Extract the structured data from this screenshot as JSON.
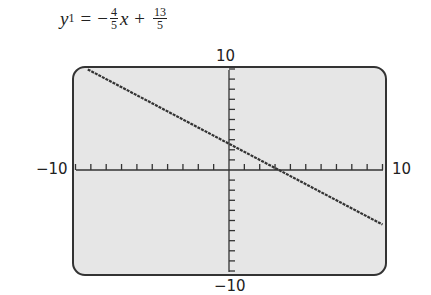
{
  "equation": {
    "lhs_var": "y",
    "lhs_sub": "1",
    "equals": "=",
    "sign": "−",
    "slope_num": "4",
    "slope_den": "5",
    "x_var": "x",
    "plus": "+",
    "int_num": "13",
    "int_den": "5"
  },
  "labels": {
    "ymax": "10",
    "ymin": "−10",
    "xmin": "−10",
    "xmax": "10"
  },
  "colors": {
    "screen_bg": "#e6e6e6",
    "frame": "#333333",
    "line": "#333333"
  },
  "chart_data": {
    "type": "line",
    "xlabel": "",
    "ylabel": "",
    "xlim": [
      -10,
      10
    ],
    "ylim": [
      -10,
      10
    ],
    "xscl": 1,
    "yscl": 1,
    "grid": false,
    "series": [
      {
        "name": "y1",
        "x": [
          -10,
          10
        ],
        "values": [
          10.6,
          -5.4
        ]
      }
    ],
    "slope": -0.8,
    "intercept": 2.6,
    "x_intercept": 3.25,
    "annotations": [
      "10",
      "−10",
      "−10",
      "10"
    ]
  }
}
